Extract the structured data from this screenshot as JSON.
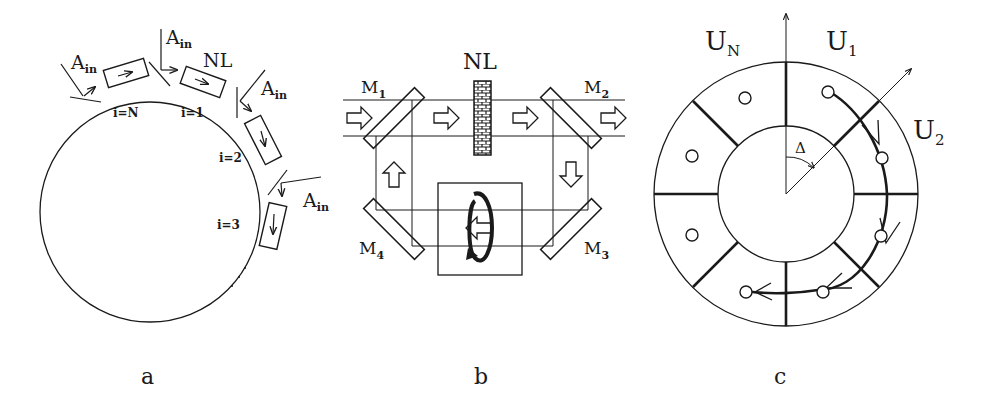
{
  "figure": {
    "panels": [
      {
        "id": "a",
        "caption": "a",
        "description": "Ring of N cells with nonlinear element NL and injected amplitude A_in at each boundary",
        "nonlinear_label": "NL",
        "input_label_base": "A",
        "input_label_sub": "in",
        "cells": [
          {
            "label": "i=N"
          },
          {
            "label": "i=1"
          },
          {
            "label": "i=2"
          },
          {
            "label": "i=3"
          }
        ],
        "continuation": "· · ·"
      },
      {
        "id": "b",
        "caption": "b",
        "description": "Four-mirror ring cavity with nonlinear element NL and polarization rotator",
        "nonlinear_label": "NL",
        "mirrors": [
          {
            "base": "M",
            "sub": "1"
          },
          {
            "base": "M",
            "sub": "2"
          },
          {
            "base": "M",
            "sub": "3"
          },
          {
            "base": "M",
            "sub": "4"
          }
        ]
      },
      {
        "id": "c",
        "caption": "c",
        "description": "Annular ring divided into sectors U_1..U_N with rotation angle Delta",
        "sectors": [
          {
            "base": "U",
            "sub": "N"
          },
          {
            "base": "U",
            "sub": "1"
          },
          {
            "base": "U",
            "sub": "2"
          }
        ],
        "angle_label": "Δ"
      }
    ]
  }
}
